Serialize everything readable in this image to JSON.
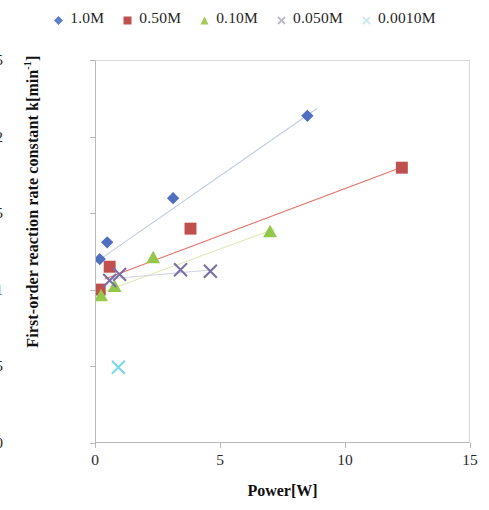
{
  "chart_data": {
    "type": "scatter",
    "title": "",
    "xlabel": "Power[W]",
    "ylabel": "First-order reaction rate constant k[min-1]",
    "ylabel_plain": "First-order reaction rate constant k[min",
    "ylabel_sup": "-1",
    "ylabel_tail": "]",
    "xlim": [
      0,
      15
    ],
    "ylim": [
      0,
      0.025
    ],
    "xticks": [
      "0",
      "5",
      "10",
      "15"
    ],
    "xtick_values": [
      0,
      5,
      10,
      15
    ],
    "yticks": [
      "0",
      "0.005",
      "0.01",
      "0.015",
      "0.02",
      "0.025"
    ],
    "ytick_values": [
      0,
      0.005,
      0.01,
      0.015,
      0.02,
      0.025
    ],
    "grid": false,
    "legend_position": "top",
    "series": [
      {
        "name": "1.0M",
        "marker": "diamond",
        "color": "#4f6fc0",
        "trendline_color": "#c3cbe2",
        "points": [
          {
            "x": 0.15,
            "y": 0.012
          },
          {
            "x": 0.45,
            "y": 0.0131
          },
          {
            "x": 3.1,
            "y": 0.016
          },
          {
            "x": 8.5,
            "y": 0.0214
          }
        ],
        "trendline": {
          "x0": 0.0,
          "y0": 0.0118,
          "x1": 8.9,
          "y1": 0.0219
        }
      },
      {
        "name": "0.50M",
        "marker": "square",
        "color": "#c0504d",
        "trendline_color": "#e8716b",
        "points": [
          {
            "x": 0.15,
            "y": 0.01
          },
          {
            "x": 0.55,
            "y": 0.0115
          },
          {
            "x": 3.8,
            "y": 0.014
          },
          {
            "x": 12.3,
            "y": 0.018
          }
        ],
        "trendline": {
          "x0": 0.35,
          "y0": 0.0107,
          "x1": 12.4,
          "y1": 0.0181
        }
      },
      {
        "name": "0.10M",
        "marker": "triangle",
        "color": "#93c84a",
        "trendline_color": "#e2e8b4",
        "points": [
          {
            "x": 0.2,
            "y": 0.0096
          },
          {
            "x": 0.75,
            "y": 0.0102
          },
          {
            "x": 2.3,
            "y": 0.0121
          },
          {
            "x": 7.0,
            "y": 0.0138
          }
        ],
        "trendline": {
          "x0": 0.2,
          "y0": 0.0098,
          "x1": 7.2,
          "y1": 0.014
        }
      },
      {
        "name": "0.050M",
        "marker": "cross",
        "color": "#7a6fa6",
        "trendline_color": "#cfd3e0",
        "points": [
          {
            "x": 0.55,
            "y": 0.0106
          },
          {
            "x": 0.95,
            "y": 0.011
          },
          {
            "x": 3.4,
            "y": 0.0113
          },
          {
            "x": 4.6,
            "y": 0.0112
          }
        ],
        "trendline": {
          "x0": 0.5,
          "y0": 0.0107,
          "x1": 4.7,
          "y1": 0.0113
        }
      },
      {
        "name": "0.0010M",
        "marker": "cross",
        "color": "#7ad9e8",
        "trendline_color": "#d7f2f7",
        "points": [
          {
            "x": 0.9,
            "y": 0.0049
          }
        ],
        "trendline": null
      }
    ]
  },
  "legend": {
    "items": [
      {
        "label": "1.0M",
        "marker": "diamond",
        "color": "#5b7ec9"
      },
      {
        "label": "0.50M",
        "marker": "square",
        "color": "#c0504d"
      },
      {
        "label": "0.10M",
        "marker": "triangle",
        "color": "#a0cc55"
      },
      {
        "label": "0.050M",
        "marker": "cross",
        "color": "#b9b9c9"
      },
      {
        "label": "0.0010M",
        "marker": "cross",
        "color": "#cfe9f0"
      }
    ]
  }
}
